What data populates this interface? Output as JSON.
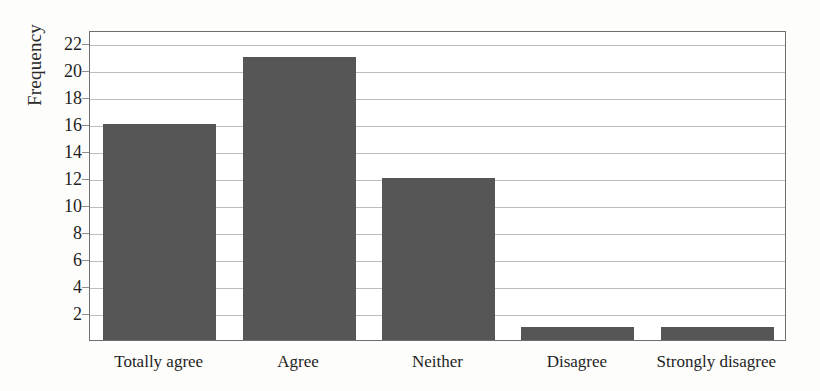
{
  "chart_data": {
    "type": "bar",
    "title": "",
    "subtitle": "",
    "xlabel": "",
    "ylabel": "Frequency",
    "categories": [
      "Totally agree",
      "Agree",
      "Neither",
      "Disagree",
      "Strongly disagree"
    ],
    "values": [
      16,
      21,
      12,
      1,
      1
    ],
    "series": [
      {
        "name": "Frequency",
        "values": [
          16,
          21,
          12,
          1,
          1
        ]
      }
    ],
    "ylim": [
      0,
      23
    ],
    "ytick_values": [
      2,
      4,
      6,
      8,
      10,
      12,
      14,
      16,
      18,
      20,
      22
    ],
    "ytick_labels": [
      "2",
      "4",
      "6",
      "8",
      "10",
      "12",
      "14",
      "16",
      "18",
      "20",
      "22"
    ],
    "grid": true,
    "grid_axis": "y",
    "legend": false,
    "legend_position": "none",
    "bar_color": "#565656",
    "gridline_color": "#bdbdbd",
    "frame_color": "#6f6f6f",
    "background_color": "#ffffff"
  }
}
